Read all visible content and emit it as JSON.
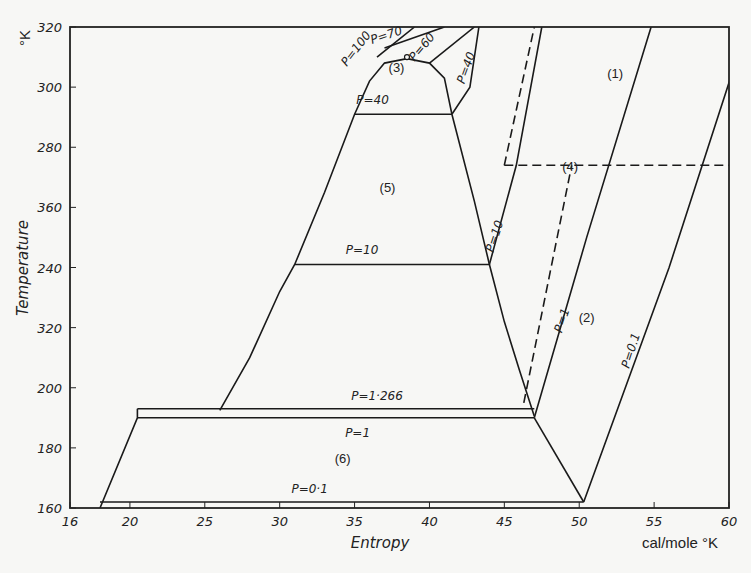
{
  "chart_data": {
    "type": "line",
    "title": "",
    "xlabel": "Entropy",
    "xunit": "cal/mole °K",
    "ylabel": "Temperature",
    "yunit": "°K",
    "xlim": [
      16,
      60
    ],
    "ylim": [
      160,
      320
    ],
    "grid": false,
    "x_ticks": [
      16,
      20,
      25,
      30,
      35,
      40,
      45,
      50,
      55,
      60
    ],
    "x_tick_labels": [
      "16",
      "20",
      "25",
      "30",
      "35",
      "40",
      "45",
      "50",
      "55",
      "60"
    ],
    "y_ticks": [
      160,
      180,
      200,
      220,
      240,
      260,
      280,
      300,
      320
    ],
    "y_tick_labels": [
      "160",
      "180",
      "200",
      "320",
      "240",
      "360",
      "280",
      "300",
      "320"
    ],
    "series": [
      {
        "name": "saturation-dome-left",
        "style": "solid",
        "points": [
          [
            26,
            192.5
          ],
          [
            28,
            210
          ],
          [
            30,
            232
          ],
          [
            31,
            241
          ],
          [
            33,
            265
          ],
          [
            35,
            291
          ],
          [
            36,
            302
          ],
          [
            37,
            308
          ],
          [
            38.5,
            309.5
          ]
        ]
      },
      {
        "name": "saturation-dome-right",
        "style": "solid",
        "points": [
          [
            38.5,
            309.5
          ],
          [
            40,
            308
          ],
          [
            41,
            303
          ],
          [
            41.5,
            291
          ],
          [
            43,
            262
          ],
          [
            44,
            241
          ],
          [
            45,
            222
          ],
          [
            46,
            206
          ],
          [
            47,
            190.5
          ]
        ]
      },
      {
        "name": "P=40 tie-line",
        "style": "solid",
        "points": [
          [
            35,
            291
          ],
          [
            41.5,
            291
          ]
        ]
      },
      {
        "name": "P=10 tie-line",
        "style": "solid",
        "points": [
          [
            31,
            241
          ],
          [
            44,
            241
          ]
        ]
      },
      {
        "name": "P=1.266 triple line",
        "style": "solid",
        "points": [
          [
            20.5,
            193
          ],
          [
            47,
            193
          ]
        ]
      },
      {
        "name": "P=1 solid line",
        "style": "solid",
        "points": [
          [
            20.5,
            190
          ],
          [
            47,
            190
          ]
        ]
      },
      {
        "name": "P=0.1 solid line",
        "style": "solid",
        "points": [
          [
            18,
            162
          ],
          [
            50.3,
            162
          ]
        ]
      },
      {
        "name": "solid-left-boundary",
        "style": "solid",
        "points": [
          [
            18,
            160
          ],
          [
            20.5,
            190
          ],
          [
            20.5,
            193
          ]
        ]
      },
      {
        "name": "bottom-right-boundary",
        "style": "solid",
        "points": [
          [
            47,
            190
          ],
          [
            50.3,
            162
          ]
        ]
      },
      {
        "name": "P=100",
        "style": "solid",
        "points": [
          [
            36.5,
            310
          ],
          [
            39,
            320
          ]
        ]
      },
      {
        "name": "P=70",
        "style": "solid",
        "points": [
          [
            37,
            313
          ],
          [
            41,
            320
          ]
        ]
      },
      {
        "name": "P=60",
        "style": "solid",
        "points": [
          [
            40,
            308
          ],
          [
            43,
            320
          ]
        ]
      },
      {
        "name": "P=40 gas",
        "style": "solid",
        "points": [
          [
            41.5,
            291
          ],
          [
            42.7,
            300
          ],
          [
            43.3,
            320
          ]
        ]
      },
      {
        "name": "P=10 gas",
        "style": "solid",
        "points": [
          [
            44,
            241
          ],
          [
            45.8,
            274
          ],
          [
            47.5,
            320
          ]
        ]
      },
      {
        "name": "P=1 gas",
        "style": "solid",
        "points": [
          [
            47,
            190
          ],
          [
            50.5,
            250
          ],
          [
            54.8,
            320
          ]
        ]
      },
      {
        "name": "P=0.1 gas",
        "style": "solid",
        "points": [
          [
            50.3,
            162
          ],
          [
            56,
            240
          ],
          [
            61.2,
            320
          ]
        ]
      },
      {
        "name": "dashed-274K",
        "style": "dashed",
        "points": [
          [
            45,
            274
          ],
          [
            60,
            274
          ]
        ]
      },
      {
        "name": "dashed-vertical-upper",
        "style": "dashed",
        "points": [
          [
            45,
            274
          ],
          [
            47,
            320
          ]
        ]
      },
      {
        "name": "dashed-lower",
        "style": "dashed",
        "points": [
          [
            46.3,
            195
          ],
          [
            49.5,
            274
          ]
        ]
      }
    ],
    "annotations": [
      {
        "text": "P=100",
        "x": 35.3,
        "y": 312,
        "rotate": -52
      },
      {
        "text": "P=70",
        "x": 37.2,
        "y": 316,
        "rotate": -18
      },
      {
        "text": "P=60",
        "x": 39.7,
        "y": 312.5,
        "rotate": -50
      },
      {
        "text": "P=40",
        "x": 42.7,
        "y": 306,
        "rotate": -70
      },
      {
        "text": "(3)",
        "x": 37.8,
        "y": 305,
        "rotate": 0
      },
      {
        "text": "P=40",
        "x": 36.2,
        "y": 294.5,
        "rotate": 0
      },
      {
        "text": "(5)",
        "x": 37.2,
        "y": 265,
        "rotate": 0
      },
      {
        "text": "P=10",
        "x": 35.5,
        "y": 244.5,
        "rotate": 0
      },
      {
        "text": "P=10",
        "x": 44.6,
        "y": 250,
        "rotate": -72
      },
      {
        "text": "(1)",
        "x": 52.4,
        "y": 303,
        "rotate": 0
      },
      {
        "text": "(4)",
        "x": 49.4,
        "y": 272,
        "rotate": 0
      },
      {
        "text": "P=1",
        "x": 49.1,
        "y": 222,
        "rotate": -72
      },
      {
        "text": "(2)",
        "x": 50.5,
        "y": 222,
        "rotate": 0
      },
      {
        "text": "P=0.1",
        "x": 53.7,
        "y": 212,
        "rotate": -72
      },
      {
        "text": "P=1·266",
        "x": 36.5,
        "y": 196,
        "rotate": 0
      },
      {
        "text": "P=1",
        "x": 35.2,
        "y": 183.5,
        "rotate": 0
      },
      {
        "text": "(6)",
        "x": 34.2,
        "y": 175,
        "rotate": 0
      },
      {
        "text": "P=0·1",
        "x": 32,
        "y": 165,
        "rotate": 0
      }
    ],
    "legend": "none"
  }
}
